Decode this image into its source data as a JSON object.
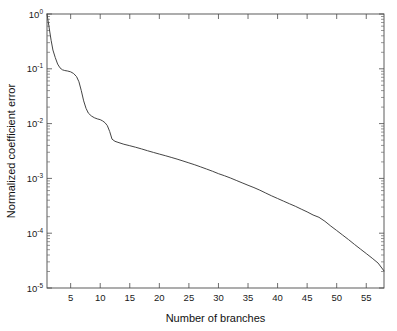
{
  "chart_data": {
    "type": "line",
    "title": "",
    "xlabel": "Number of branches",
    "ylabel": "Normalized coefficient error",
    "xlim": [
      1,
      58
    ],
    "ylim": [
      1e-05,
      1
    ],
    "yscale": "log",
    "xscale": "linear",
    "grid": false,
    "legend": null,
    "xticks": [
      5,
      10,
      15,
      20,
      25,
      30,
      35,
      40,
      45,
      50,
      55
    ],
    "xtick_labels": [
      "5",
      "10",
      "15",
      "20",
      "25",
      "30",
      "35",
      "40",
      "45",
      "50",
      "55"
    ],
    "yticks": [
      1,
      0.1,
      0.01,
      0.001,
      0.0001,
      1e-05
    ],
    "ytick_labels": [
      "10^0",
      "10^-1",
      "10^-2",
      "10^-3",
      "10^-4",
      "10^-5"
    ],
    "ytick_mantissa": [
      "10",
      "10",
      "10",
      "10",
      "10",
      "10"
    ],
    "ytick_exponent": [
      "0",
      "-1",
      "-2",
      "-3",
      "-4",
      "-5"
    ],
    "series": [
      {
        "name": "normalized coefficient error",
        "color": "#3a3a3a",
        "x": [
          1,
          1.3,
          1.7,
          2,
          2.4,
          2.8,
          3.2,
          3.6,
          4,
          4.5,
          5,
          5.5,
          6,
          6.4,
          6.8,
          7.2,
          7.6,
          8,
          8.5,
          9,
          9.5,
          10,
          10.4,
          10.8,
          11.2,
          11.6,
          12,
          12.5,
          13,
          14,
          15,
          16,
          17,
          18,
          19,
          20,
          21,
          22,
          23,
          24,
          25,
          26,
          27,
          28,
          29,
          30,
          31,
          32,
          33,
          34,
          35,
          36,
          37,
          38,
          39,
          40,
          41,
          42,
          43,
          44,
          45,
          46,
          47,
          48,
          49,
          50,
          51,
          52,
          53,
          54,
          55,
          56,
          57,
          58
        ],
        "y": [
          1.0,
          0.62,
          0.33,
          0.22,
          0.16,
          0.122,
          0.104,
          0.096,
          0.093,
          0.091,
          0.088,
          0.082,
          0.072,
          0.058,
          0.04,
          0.026,
          0.019,
          0.0155,
          0.0138,
          0.0128,
          0.0122,
          0.0118,
          0.0112,
          0.0104,
          0.0092,
          0.0072,
          0.0052,
          0.00475,
          0.00455,
          0.0042,
          0.00395,
          0.0037,
          0.00345,
          0.0032,
          0.00298,
          0.00278,
          0.0026,
          0.00242,
          0.00225,
          0.00208,
          0.00192,
          0.00177,
          0.00162,
          0.00148,
          0.00135,
          0.00122,
          0.00112,
          0.00102,
          0.00092,
          0.00083,
          0.00075,
          0.00068,
          0.00061,
          0.00054,
          0.00048,
          0.00043,
          0.000385,
          0.000345,
          0.00031,
          0.000275,
          0.000245,
          0.000215,
          0.000195,
          0.000165,
          0.000135,
          0.000112,
          9.25e-05,
          7.65e-05,
          6.25e-05,
          5.15e-05,
          4.25e-05,
          3.5e-05,
          2.85e-05,
          2.05e-05
        ]
      }
    ]
  },
  "axes": {
    "x_axis_label": "Number of branches",
    "y_axis_label": "Normalized coefficient error"
  }
}
